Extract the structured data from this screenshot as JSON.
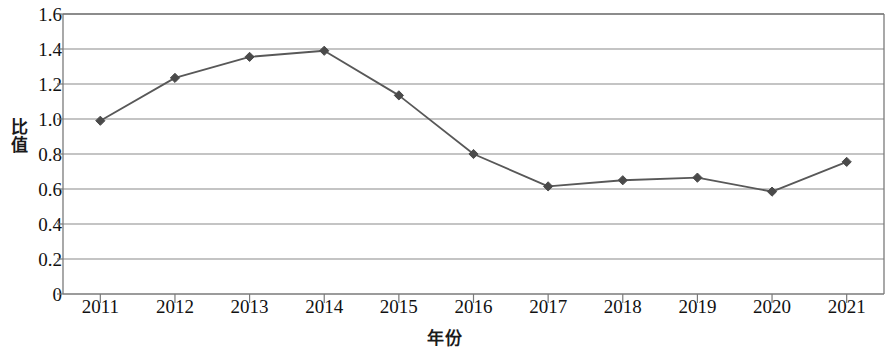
{
  "chart_data": {
    "type": "line",
    "title": "",
    "xlabel": "年份",
    "ylabel": "比值",
    "categories": [
      "2011",
      "2012",
      "2013",
      "2014",
      "2015",
      "2016",
      "2017",
      "2018",
      "2019",
      "2020",
      "2021"
    ],
    "values": [
      0.99,
      1.235,
      1.355,
      1.39,
      1.135,
      0.8,
      0.615,
      0.65,
      0.665,
      0.585,
      0.755
    ],
    "series": [
      {
        "name": "比值",
        "values": [
          0.99,
          1.235,
          1.355,
          1.39,
          1.135,
          0.8,
          0.615,
          0.65,
          0.665,
          0.585,
          0.755
        ]
      }
    ],
    "ylim": [
      0,
      1.6
    ],
    "y_ticks": [
      "0",
      "0.2",
      "0.4",
      "0.6",
      "0.8",
      "1.0",
      "1.2",
      "1.4",
      "1.6"
    ],
    "y_tick_values": [
      0,
      0.2,
      0.4,
      0.6,
      0.8,
      1.0,
      1.2,
      1.4,
      1.6
    ],
    "x_ticks": [
      "2011",
      "2012",
      "2013",
      "2014",
      "2015",
      "2016",
      "2017",
      "2018",
      "2019",
      "2020",
      "2021"
    ],
    "grid": "horizontal",
    "legend": "none",
    "marker": "diamond",
    "line_color": "#585858",
    "marker_color": "#4a4a4a",
    "grid_color": "#8a8a8a",
    "axis_color": "#7a7a7a",
    "text_color": "#111111"
  }
}
